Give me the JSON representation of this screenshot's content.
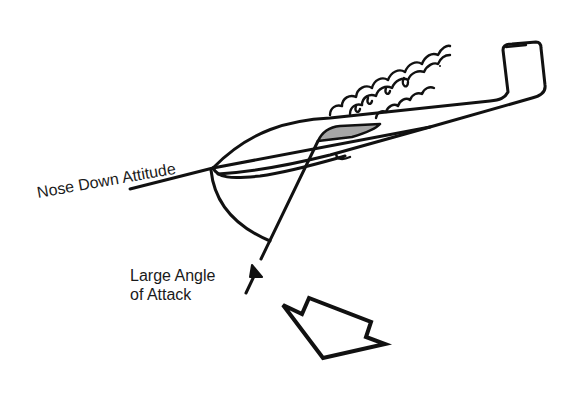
{
  "diagram": {
    "labels": {
      "attitude": "Nose Down Attitude",
      "angle_line1": "Large Angle",
      "angle_line2": "of Attack"
    },
    "colors": {
      "ink": "#111111",
      "wing_fill": "#a6a6a6",
      "background": "#ffffff"
    },
    "elements": [
      "glider-outline",
      "wing-shaded",
      "turbulent-airflow",
      "nose-down-attitude-line",
      "relative-wind-line",
      "angle-arc",
      "relative-wind-arrow",
      "block-arrow"
    ]
  }
}
